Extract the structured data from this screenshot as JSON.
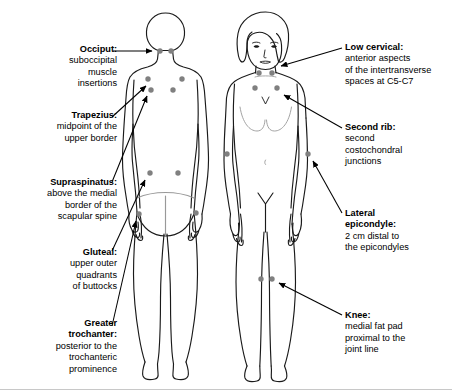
{
  "diagram": {
    "background_color": "#ffffff",
    "outline_color": "#1a1a1a",
    "dot_color": "#808080",
    "arrow_color": "#000000"
  },
  "labels": [
    {
      "id": "occiput",
      "title": "Occiput:",
      "lines": [
        "suboccipital",
        "muscle",
        "insertions"
      ],
      "side": "left",
      "x": 10,
      "y": 44,
      "width": 107
    },
    {
      "id": "trapezius",
      "title": "Trapezius:",
      "lines": [
        "midpoint of the",
        "upper border"
      ],
      "side": "left",
      "x": 10,
      "y": 110,
      "width": 107
    },
    {
      "id": "supraspinatus",
      "title": "Supraspinatus:",
      "lines": [
        "above the medial",
        "border of the",
        "scapular spine"
      ],
      "side": "left",
      "x": 6,
      "y": 177,
      "width": 111
    },
    {
      "id": "gluteal",
      "title": "Gluteal:",
      "lines": [
        "upper outer",
        "quadrants",
        "of buttocks"
      ],
      "side": "left",
      "x": 10,
      "y": 247,
      "width": 107
    },
    {
      "id": "greater-trochanter",
      "title": "Greater",
      "title2": "trochanter:",
      "lines": [
        "posterior to the",
        "trochanteric",
        "prominence"
      ],
      "side": "left",
      "x": 10,
      "y": 318,
      "width": 107
    },
    {
      "id": "low-cervical",
      "title": "Low cervical:",
      "lines": [
        "anterior aspects",
        "of the intertransverse",
        "spaces at C5-C7"
      ],
      "side": "right",
      "x": 345,
      "y": 42,
      "width": 105
    },
    {
      "id": "second-rib",
      "title": "Second rib:",
      "lines": [
        "second",
        "costochondral",
        "junctions"
      ],
      "side": "right",
      "x": 345,
      "y": 122,
      "width": 105
    },
    {
      "id": "lateral-epicondyle",
      "title": "Lateral",
      "title2": "epicondyle:",
      "lines": [
        "2 cm distal to",
        "the epicondyles"
      ],
      "side": "right",
      "x": 345,
      "y": 208,
      "width": 105
    },
    {
      "id": "knee",
      "title": "Knee:",
      "lines": [
        "medial fat pad",
        "proximal to the",
        "joint line"
      ],
      "side": "right",
      "x": 345,
      "y": 310,
      "width": 105
    }
  ],
  "tender_points": [
    {
      "region": "occiput",
      "figure": "posterior",
      "cx": 160,
      "cy": 51
    },
    {
      "region": "occiput",
      "figure": "posterior",
      "cx": 171,
      "cy": 51
    },
    {
      "region": "trapezius",
      "figure": "posterior",
      "cx": 148,
      "cy": 79
    },
    {
      "region": "trapezius",
      "figure": "posterior",
      "cx": 182,
      "cy": 79
    },
    {
      "region": "supraspinatus",
      "figure": "posterior",
      "cx": 151,
      "cy": 90
    },
    {
      "region": "supraspinatus",
      "figure": "posterior",
      "cx": 173,
      "cy": 90
    },
    {
      "region": "gluteal",
      "figure": "posterior",
      "cx": 150,
      "cy": 173
    },
    {
      "region": "gluteal",
      "figure": "posterior",
      "cx": 178,
      "cy": 173
    },
    {
      "region": "greater-trochanter",
      "figure": "posterior",
      "cx": 139,
      "cy": 214
    },
    {
      "region": "greater-trochanter",
      "figure": "posterior",
      "cx": 196,
      "cy": 213
    },
    {
      "region": "low-cervical",
      "figure": "anterior",
      "cx": 259,
      "cy": 73
    },
    {
      "region": "low-cervical",
      "figure": "anterior",
      "cx": 272,
      "cy": 73
    },
    {
      "region": "second-rib",
      "figure": "anterior",
      "cx": 255,
      "cy": 88
    },
    {
      "region": "second-rib",
      "figure": "anterior",
      "cx": 277,
      "cy": 88
    },
    {
      "region": "lateral-epicondyle",
      "figure": "anterior",
      "cx": 227,
      "cy": 154
    },
    {
      "region": "lateral-epicondyle",
      "figure": "anterior",
      "cx": 308,
      "cy": 154
    },
    {
      "region": "knee",
      "figure": "anterior",
      "cx": 261,
      "cy": 279
    },
    {
      "region": "knee",
      "figure": "anterior",
      "cx": 272,
      "cy": 279
    }
  ],
  "figures": [
    {
      "id": "posterior-figure",
      "view": "posterior",
      "description": "back view of female body"
    },
    {
      "id": "anterior-figure",
      "view": "anterior",
      "description": "front view of female body with face and hair"
    }
  ]
}
